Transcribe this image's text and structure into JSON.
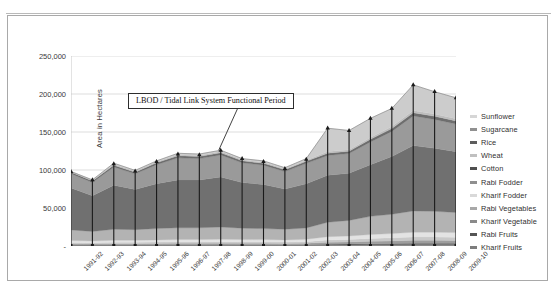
{
  "figure": {
    "annotation": "LBOD / Tidal Link System Functional Period",
    "y_axis_title": "Area in Hectares"
  },
  "chart_data": {
    "type": "area",
    "stacked": true,
    "title": "",
    "xlabel": "",
    "ylabel": "Area in Hectares",
    "ylim": [
      0,
      250000
    ],
    "yticks": [
      0,
      50000,
      100000,
      150000,
      200000,
      250000
    ],
    "ytick_labels": [
      "-",
      "50,000",
      "100,000",
      "150,000",
      "200,000",
      "250,000"
    ],
    "grid": true,
    "legend_position": "right",
    "categories": [
      "1991-92",
      "1992-93",
      "1993-94",
      "1994-95",
      "1995-96",
      "1996-97",
      "1997-98",
      "1998-99",
      "1999-00",
      "2000-01",
      "2001-02",
      "2002-03",
      "2003-04",
      "2004-05",
      "2005-06",
      "2006-07",
      "2007-08",
      "2008-09",
      "2009-10"
    ],
    "totals": [
      98000,
      87000,
      108000,
      98500,
      111000,
      121000,
      120000,
      126000,
      115000,
      111000,
      102000,
      114000,
      155000,
      152000,
      168000,
      181000,
      212000,
      203000,
      195000
    ],
    "series": [
      {
        "name": "Kharif Fruits",
        "color": "#8c8c8c",
        "values": [
          900,
          800,
          900,
          900,
          950,
          1000,
          1000,
          1050,
          1000,
          1000,
          950,
          1000,
          1300,
          1400,
          1600,
          1700,
          1900,
          1900,
          1850
        ]
      },
      {
        "name": "Rabi Fruits",
        "color": "#5a5a5a",
        "values": [
          700,
          650,
          700,
          700,
          750,
          800,
          800,
          850,
          800,
          800,
          750,
          800,
          1100,
          1200,
          1400,
          1500,
          1700,
          1700,
          1650
        ]
      },
      {
        "name": "Kharif Vegetable",
        "color": "#9e9e9e",
        "values": [
          1400,
          1300,
          1500,
          1500,
          1600,
          1700,
          1700,
          1800,
          1700,
          1700,
          1600,
          1800,
          2600,
          2800,
          3200,
          3500,
          3900,
          3900,
          3800
        ]
      },
      {
        "name": "Rabi Vegetables",
        "color": "#c9c9c9",
        "values": [
          1600,
          1500,
          1700,
          1700,
          1800,
          1900,
          1900,
          2000,
          1900,
          1900,
          1800,
          2000,
          3000,
          3200,
          3600,
          4000,
          4400,
          4400,
          4300
        ]
      },
      {
        "name": "Kharif Fodder",
        "color": "#e3e3e3",
        "values": [
          2600,
          2400,
          2700,
          2700,
          2900,
          3100,
          3100,
          3200,
          3100,
          3000,
          2900,
          3200,
          4200,
          4600,
          5200,
          5600,
          6200,
          6200,
          6000
        ]
      },
      {
        "name": "Rabi Fodder",
        "color": "#b3b3b3",
        "values": [
          14000,
          12500,
          14500,
          14000,
          15000,
          15500,
          15500,
          16000,
          15000,
          14500,
          14000,
          15000,
          19000,
          20500,
          24000,
          25500,
          28000,
          27500,
          26500
        ]
      },
      {
        "name": "Cotton",
        "color": "#707070",
        "values": [
          55000,
          47000,
          58000,
          53000,
          59000,
          63000,
          63000,
          66000,
          60000,
          58000,
          53000,
          58000,
          62000,
          62000,
          68000,
          76000,
          86000,
          83000,
          80000
        ]
      },
      {
        "name": "Wheat",
        "color": "#9a9a9a",
        "values": [
          19000,
          17500,
          24000,
          20500,
          25000,
          29000,
          28000,
          29000,
          26000,
          25500,
          23000,
          27000,
          26000,
          26000,
          30000,
          33000,
          39000,
          38000,
          36500
        ]
      },
      {
        "name": "Rice",
        "color": "#6e6e6e",
        "values": [
          2000,
          2000,
          2400,
          2200,
          2500,
          2800,
          2700,
          2800,
          2600,
          2500,
          2300,
          2600,
          3000,
          3000,
          3400,
          3700,
          4200,
          4100,
          4000
        ]
      },
      {
        "name": "Sugarcane",
        "color": "#bdbdbd",
        "values": [
          800,
          850,
          1100,
          1000,
          1200,
          1400,
          1400,
          1500,
          1300,
          1300,
          1100,
          1400,
          2000,
          2100,
          2400,
          2600,
          3000,
          2900,
          2800
        ]
      },
      {
        "name": "Kharif Vegetable Top",
        "color": "#cccccc",
        "values": [
          0,
          500,
          1500,
          1300,
          1300,
          1800,
          1900,
          1800,
          1600,
          1800,
          1600,
          2200,
          30800,
          25200,
          25200,
          23900,
          33700,
          29400,
          27600
        ]
      }
    ],
    "legend": [
      {
        "label": "Sunflower",
        "color": "#d6d6d6"
      },
      {
        "label": "Sugarcane",
        "color": "#909090"
      },
      {
        "label": "Rice",
        "color": "#5d5d5d"
      },
      {
        "label": "Wheat",
        "color": "#c0c0c0"
      },
      {
        "label": "Cotton",
        "color": "#4f4f4f"
      },
      {
        "label": "Rabi Fodder",
        "color": "#8f8f8f"
      },
      {
        "label": "Kharif Fodder",
        "color": "#d9d9d9"
      },
      {
        "label": "Rabi Vegetables",
        "color": "#a8a8a8"
      },
      {
        "label": "Kharif Vegetable",
        "color": "#8a8a8a"
      },
      {
        "label": "Rabi Fruits",
        "color": "#555555"
      },
      {
        "label": "Kharif Fruits",
        "color": "#7d7d7d"
      }
    ]
  }
}
